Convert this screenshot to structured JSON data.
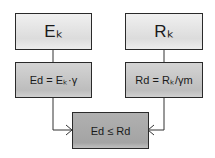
{
  "diagram": {
    "type": "flowchart",
    "nodes": {
      "ek": {
        "label": "Eₖ"
      },
      "rk": {
        "label": "Rₖ"
      },
      "ed": {
        "label": "Ed = Eₖ·γ"
      },
      "rd": {
        "label": "Rd = Rₖ/γm"
      },
      "check": {
        "label": "Ed ≤ Rd"
      }
    },
    "edges": [
      {
        "from": "ek",
        "to": "ed"
      },
      {
        "from": "rk",
        "to": "rd"
      },
      {
        "from": "ed",
        "to": "check"
      },
      {
        "from": "rd",
        "to": "check"
      }
    ]
  }
}
